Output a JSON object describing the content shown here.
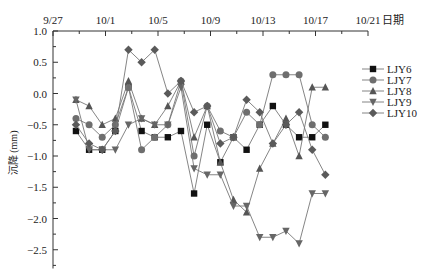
{
  "chart_data": {
    "type": "line",
    "title": "",
    "xlabel": "日期",
    "ylabel": "沉降 (mm)",
    "x_axis_position": "top",
    "x_tick_labels": [
      "9/27",
      "10/1",
      "10/5",
      "10/9",
      "10/13",
      "10/17",
      "10/21"
    ],
    "y_tick_labels": [
      "1.0",
      "0.5",
      "0.0",
      "-0.5",
      "-1.0",
      "-1.5",
      "-2.0",
      "-2.5"
    ],
    "xlim_days_from_9_27": [
      0,
      24
    ],
    "ylim": [
      -2.8,
      1.0
    ],
    "grid": false,
    "legend_position": "right",
    "x": [
      "9/28",
      "9/29",
      "9/30",
      "10/1",
      "10/2",
      "10/3",
      "10/4",
      "10/5",
      "10/6",
      "10/7",
      "10/8",
      "10/9",
      "10/10",
      "10/11",
      "10/12",
      "10/13",
      "10/14",
      "10/15",
      "10/16",
      "10/17"
    ],
    "x_day_offsets": [
      1.75,
      2.75,
      3.75,
      4.75,
      5.75,
      6.75,
      7.75,
      8.75,
      9.75,
      10.75,
      11.75,
      12.75,
      13.75,
      14.75,
      15.75,
      16.75,
      17.75,
      18.75,
      19.75,
      20.75
    ],
    "series": [
      {
        "name": "LJY6",
        "marker": "square",
        "values": [
          -0.6,
          -0.9,
          -0.9,
          -0.6,
          0.1,
          -0.6,
          -0.7,
          -0.7,
          -0.6,
          -1.6,
          -0.5,
          -1.1,
          -0.7,
          -0.9,
          -0.5,
          -0.2,
          -0.5,
          -0.7,
          -0.7,
          -0.5
        ]
      },
      {
        "name": "LJY7",
        "marker": "circle",
        "values": [
          -0.4,
          -0.5,
          -0.7,
          -0.5,
          0.1,
          -0.9,
          -0.7,
          -0.5,
          0.2,
          -1.0,
          -0.2,
          -0.6,
          -0.7,
          -0.3,
          -0.5,
          0.3,
          0.3,
          0.3,
          -0.5,
          -0.7
        ]
      },
      {
        "name": "LJY8",
        "marker": "triangle-up",
        "values": [
          -0.1,
          -0.2,
          -0.5,
          -0.4,
          0.2,
          -0.4,
          -0.5,
          -0.2,
          0.2,
          -0.7,
          -0.2,
          -1.1,
          -1.7,
          -1.9,
          -1.2,
          -0.8,
          -0.4,
          -1.0,
          0.1,
          0.1
        ]
      },
      {
        "name": "LJY9",
        "marker": "triangle-down",
        "values": [
          -0.1,
          -0.9,
          -0.9,
          -0.9,
          -0.5,
          -0.4,
          -0.5,
          -0.5,
          0.1,
          -1.2,
          -1.3,
          -1.3,
          -1.8,
          -1.8,
          -2.3,
          -2.3,
          -2.2,
          -2.4,
          -1.6,
          -1.6
        ]
      },
      {
        "name": "LJY10",
        "marker": "diamond",
        "values": [
          -0.5,
          -0.8,
          -0.9,
          -0.6,
          0.7,
          0.5,
          0.7,
          0.0,
          0.2,
          -0.3,
          -0.2,
          -0.8,
          -0.7,
          -0.1,
          -0.3,
          -0.8,
          -0.5,
          -0.3,
          -0.9,
          -1.3
        ]
      }
    ],
    "colors": {
      "LJY6": "#111111",
      "LJY7": "#6e6e6e",
      "LJY8": "#555555",
      "LJY9": "#666666",
      "LJY10": "#5a5a5a",
      "line": "#777777",
      "axis": "#333333"
    }
  }
}
